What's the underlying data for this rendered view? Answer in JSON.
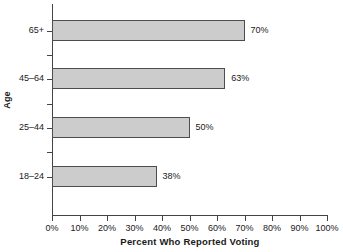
{
  "chart_data": {
    "type": "bar",
    "orientation": "horizontal",
    "title": "",
    "xlabel": "Percent Who Reported Voting",
    "ylabel": "Age",
    "categories": [
      "18–24",
      "25–44",
      "45–64",
      "65+"
    ],
    "values": [
      38,
      50,
      63,
      70
    ],
    "value_labels": [
      "38%",
      "50%",
      "63%",
      "70%"
    ],
    "xlim": [
      0,
      100
    ],
    "xticks": [
      0,
      10,
      20,
      30,
      40,
      50,
      60,
      70,
      80,
      90,
      100
    ],
    "xtick_labels": [
      "0%",
      "10%",
      "20%",
      "30%",
      "40%",
      "50%",
      "60%",
      "70%",
      "80%",
      "90%",
      "100%"
    ],
    "grid": false,
    "legend": false,
    "bar_color": "#cccccc",
    "bar_border_color": "#4d4d4d",
    "axis_color": "#444444"
  },
  "axes": {
    "y_title": "Age",
    "x_title": "Percent Who Reported Voting"
  },
  "bars": [
    {
      "category": "65+",
      "value": 70,
      "label": "70%"
    },
    {
      "category": "45–64",
      "value": 63,
      "label": "63%"
    },
    {
      "category": "25–44",
      "value": 50,
      "label": "50%"
    },
    {
      "category": "18–24",
      "value": 38,
      "label": "38%"
    }
  ],
  "xticks": [
    {
      "label": "0%",
      "value": 0
    },
    {
      "label": "10%",
      "value": 10
    },
    {
      "label": "20%",
      "value": 20
    },
    {
      "label": "30%",
      "value": 30
    },
    {
      "label": "40%",
      "value": 40
    },
    {
      "label": "50%",
      "value": 50
    },
    {
      "label": "60%",
      "value": 60
    },
    {
      "label": "70%",
      "value": 70
    },
    {
      "label": "80%",
      "value": 80
    },
    {
      "label": "90%",
      "value": 90
    },
    {
      "label": "100%",
      "value": 100
    }
  ]
}
